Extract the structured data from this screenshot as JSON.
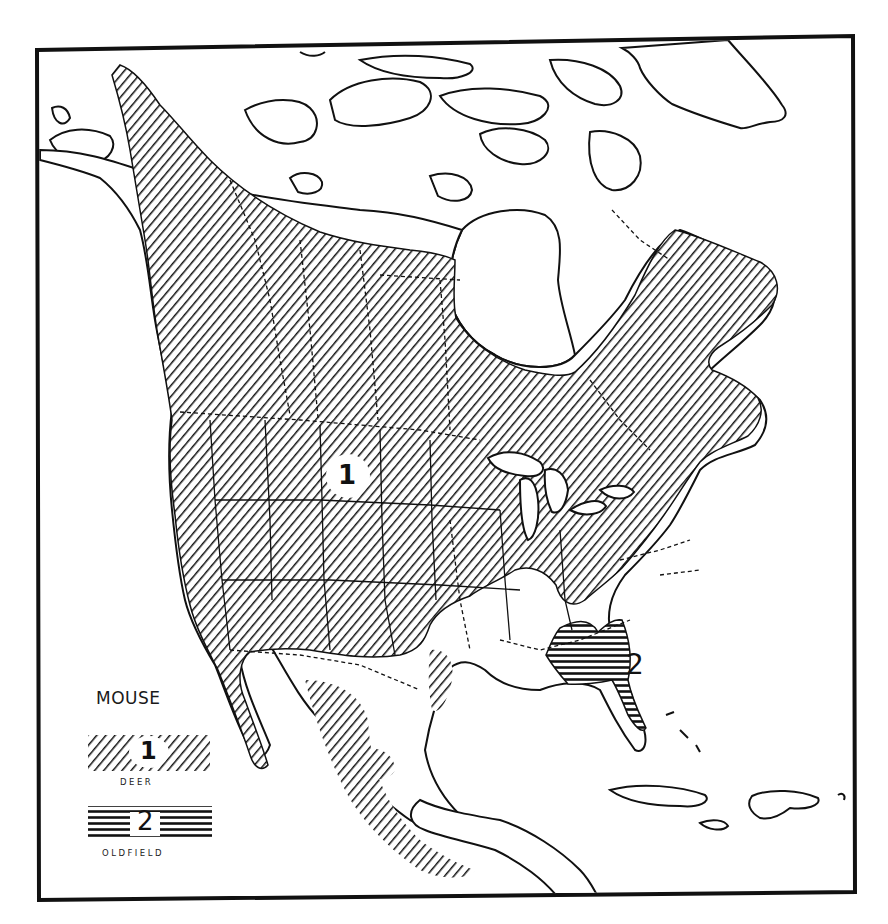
{
  "map": {
    "title": "Range map of Deer Mouse and Oldfield Mouse in North America",
    "region": "North America",
    "colors": {
      "ink": "#111111",
      "background": "#ffffff"
    },
    "range_labels": [
      {
        "id": "1",
        "label": "1",
        "species": "Deer",
        "position": "central Great Plains, inside white circle"
      },
      {
        "id": "2",
        "label": "2",
        "species": "Oldfield",
        "position": "off coast of Georgia / northern Florida"
      }
    ]
  },
  "legend": {
    "title": "MOUSE",
    "items": [
      {
        "number": "1",
        "name": "DEER",
        "pattern": "diagonal-hatch"
      },
      {
        "number": "2",
        "name": "OLDFIELD",
        "pattern": "horizontal-hatch"
      }
    ]
  }
}
